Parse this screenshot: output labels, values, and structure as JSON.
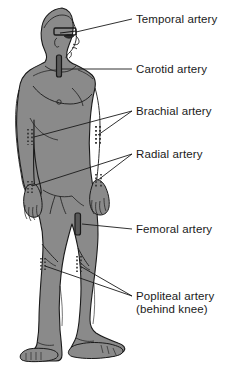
{
  "figure": {
    "background_color": "#ffffff",
    "body_fill_color": "#8a8a8a",
    "outline_color": "#1a1a1a",
    "marker_color": "#2b2b2b"
  },
  "labels": [
    {
      "id": "temporal",
      "text": "Temporal artery",
      "sub": ""
    },
    {
      "id": "carotid",
      "text": "Carotid artery",
      "sub": ""
    },
    {
      "id": "brachial",
      "text": "Brachial artery",
      "sub": ""
    },
    {
      "id": "radial",
      "text": "Radial artery",
      "sub": ""
    },
    {
      "id": "femoral",
      "text": "Femoral artery",
      "sub": ""
    },
    {
      "id": "popliteal",
      "text": "Popliteal artery",
      "sub": "(behind knee)"
    }
  ],
  "markers": {
    "temporal": "solid-bar-at-temple",
    "carotid": "solid-bar-on-neck",
    "brachial": "dotted-marks-at-inner-elbows",
    "radial": "dotted-marks-at-wrists",
    "femoral": "solid-bar-on-upper-thigh",
    "popliteal": "dotted-marks-behind-knees"
  }
}
